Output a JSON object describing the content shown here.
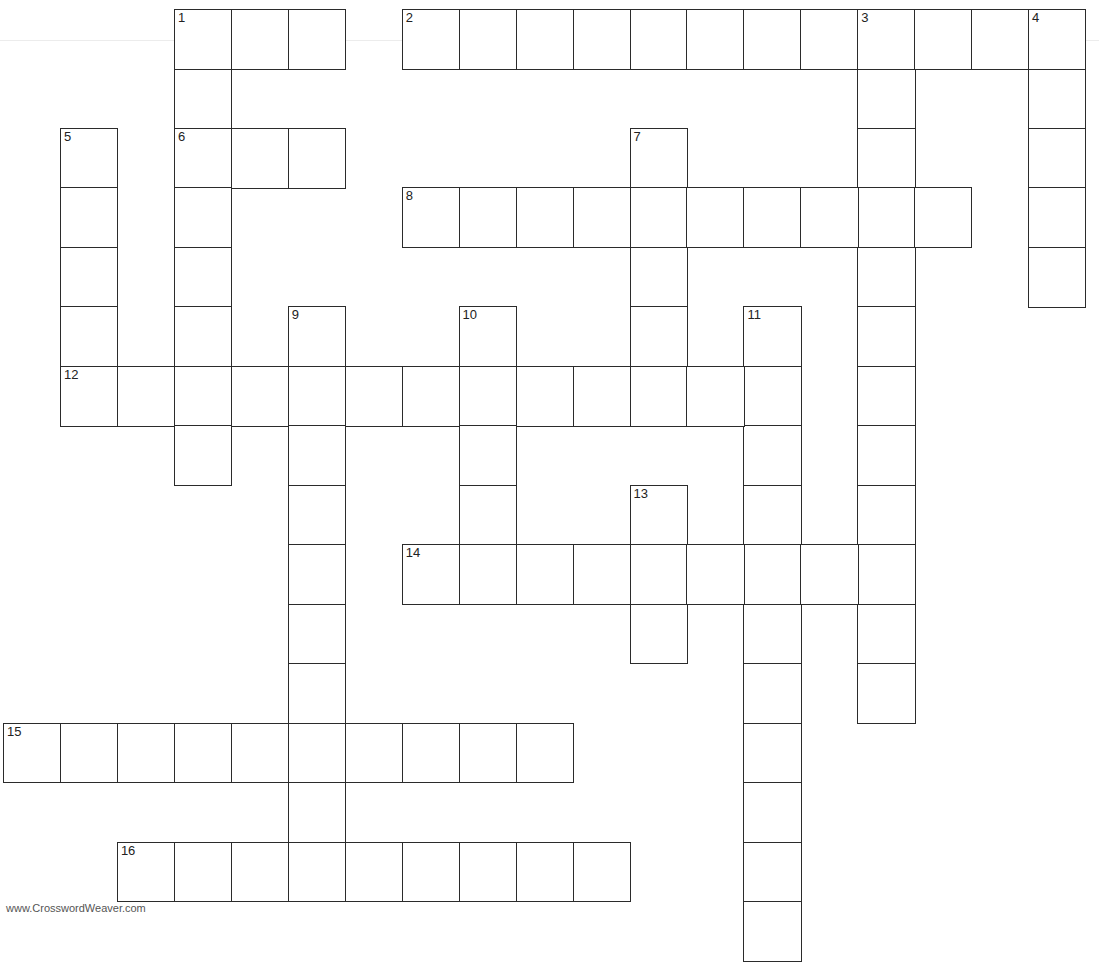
{
  "grid": {
    "origin_x": 3,
    "origin_y": 9,
    "cell_w": 56.95,
    "cell_h": 59.47,
    "border_color": "#2b2b2b"
  },
  "entries": [
    {
      "number": 1,
      "direction": "across",
      "row": 0,
      "col": 3,
      "length": 3
    },
    {
      "number": 1,
      "direction": "down",
      "row": 0,
      "col": 3,
      "length": 8
    },
    {
      "number": 2,
      "direction": "across",
      "row": 0,
      "col": 7,
      "length": 12
    },
    {
      "number": 3,
      "direction": "down",
      "row": 0,
      "col": 15,
      "length": 12
    },
    {
      "number": 4,
      "direction": "down",
      "row": 0,
      "col": 18,
      "length": 5
    },
    {
      "number": 5,
      "direction": "down",
      "row": 2,
      "col": 1,
      "length": 5
    },
    {
      "number": 6,
      "direction": "across",
      "row": 2,
      "col": 3,
      "length": 3
    },
    {
      "number": 7,
      "direction": "down",
      "row": 2,
      "col": 11,
      "length": 5
    },
    {
      "number": 8,
      "direction": "across",
      "row": 3,
      "col": 7,
      "length": 10
    },
    {
      "number": 9,
      "direction": "down",
      "row": 5,
      "col": 5,
      "length": 10
    },
    {
      "number": 10,
      "direction": "down",
      "row": 5,
      "col": 8,
      "length": 4
    },
    {
      "number": 11,
      "direction": "down",
      "row": 5,
      "col": 13,
      "length": 11
    },
    {
      "number": 12,
      "direction": "across",
      "row": 6,
      "col": 1,
      "length": 13
    },
    {
      "number": 13,
      "direction": "down",
      "row": 8,
      "col": 11,
      "length": 3
    },
    {
      "number": 14,
      "direction": "across",
      "row": 9,
      "col": 7,
      "length": 9
    },
    {
      "number": 15,
      "direction": "across",
      "row": 12,
      "col": 0,
      "length": 10
    },
    {
      "number": 16,
      "direction": "across",
      "row": 14,
      "col": 2,
      "length": 9
    }
  ],
  "footer": {
    "watermark": "www.CrosswordWeaver.com"
  }
}
